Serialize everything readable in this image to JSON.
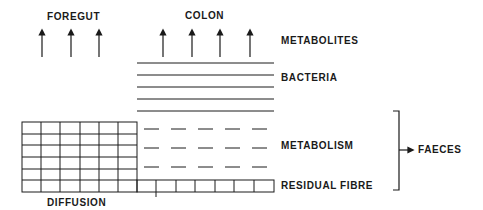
{
  "labels": {
    "foregut": "FOREGUT",
    "colon": "COLON",
    "metabolites": "METABOLITES",
    "bacteria": "BACTERIA",
    "metabolism": "METABOLISM",
    "residual_fibre": "RESIDUAL FIBRE",
    "diffusion": "DIFFUSION",
    "faeces": "FAECES"
  },
  "structure": {
    "foregut_arrows": 3,
    "colon_arrows": 4,
    "bacteria_lines": 5,
    "metabolism_dash_rows": 3,
    "metabolism_dashes_per_row": 5,
    "diffusion_grid": {
      "columns": 6,
      "rows": 6
    },
    "residual_fibre_cells": 7
  },
  "colors": {
    "ink": "#1a1a1a",
    "background": "#ffffff"
  }
}
